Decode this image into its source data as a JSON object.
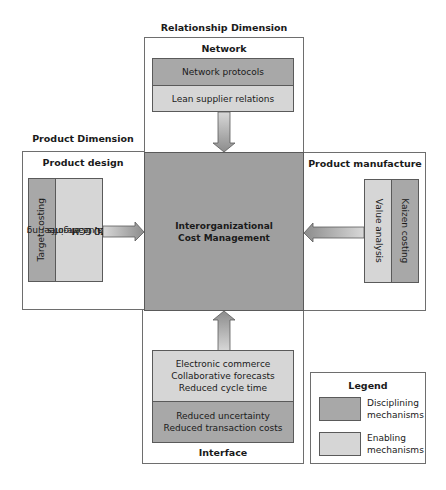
{
  "relationship_dimension": {
    "title": "Relationship Dimension",
    "panel": {
      "title": "Network",
      "items": [
        {
          "label": "Network protocols",
          "type": "disciplining"
        },
        {
          "label": "Lean supplier relations",
          "type": "enabling"
        }
      ]
    }
  },
  "product_dimension": {
    "title": "Product Dimension",
    "design_panel": {
      "title": "Product design",
      "items": [
        {
          "label": "Target costing",
          "type": "disciplining"
        },
        {
          "lines": [
            "Value engineering",
            "FPQ trade-offs",
            "ICI, CCM"
          ],
          "type": "enabling"
        }
      ]
    },
    "manufacture_panel": {
      "title": "Product manufacture",
      "items": [
        {
          "label": "Value analysis",
          "type": "enabling"
        },
        {
          "label": "Kaizen costing",
          "type": "disciplining"
        }
      ]
    }
  },
  "center": {
    "lines": [
      "Interorganizational",
      "Cost Management"
    ]
  },
  "interface_panel": {
    "title": "Interface",
    "items": [
      {
        "lines": [
          "Electronic commerce",
          "Collaborative forecasts",
          "Reduced cycle time"
        ],
        "type": "enabling"
      },
      {
        "lines": [
          "Reduced uncertainty",
          "Reduced transaction costs"
        ],
        "type": "disciplining"
      }
    ]
  },
  "legend": {
    "title": "Legend",
    "entries": [
      {
        "lines": [
          "Disciplining",
          "mechanisms"
        ],
        "color": "#a8a8a8"
      },
      {
        "lines": [
          "Enabling",
          "mechanisms"
        ],
        "color": "#d6d6d6"
      }
    ]
  },
  "colors": {
    "disciplining": "#a8a8a8",
    "enabling": "#d6d6d6",
    "center": "#9f9f9f",
    "border": "#5a5a5a"
  }
}
